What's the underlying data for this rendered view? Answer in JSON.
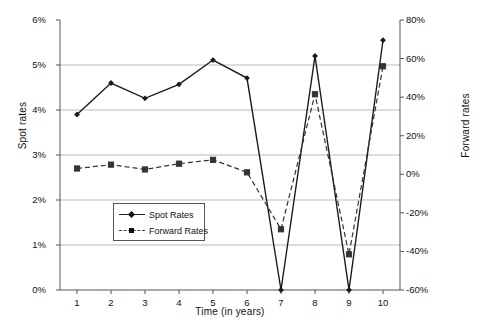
{
  "chart_data": {
    "type": "line",
    "title": "",
    "subtitle": "",
    "xlabel": "Time (in years)",
    "ylabel": "Spot rates",
    "y2label": "Forward rates",
    "x": [
      1,
      2,
      3,
      4,
      5,
      6,
      7,
      8,
      9,
      10
    ],
    "xtick_labels": [
      "1",
      "2",
      "3",
      "4",
      "5",
      "6",
      "7",
      "8",
      "9",
      "10"
    ],
    "xlim": [
      0.5,
      10.5
    ],
    "ylim": [
      0,
      6
    ],
    "y2lim": [
      -60,
      80
    ],
    "ytick_labels": [
      "0%",
      "1%",
      "2%",
      "3%",
      "4%",
      "5%",
      "6%"
    ],
    "ytick_values": [
      0,
      1,
      2,
      3,
      4,
      5,
      6
    ],
    "y2tick_labels": [
      "-60%",
      "-40%",
      "-20%",
      "0%",
      "20%",
      "40%",
      "60%",
      "80%"
    ],
    "y2tick_values": [
      -60,
      -40,
      -20,
      0,
      20,
      40,
      60,
      80
    ],
    "grid": "horizontal",
    "legend_position": "center-left-inside",
    "series": [
      {
        "name": "Spot Rates",
        "axis": "left",
        "line_style": "solid",
        "marker": "diamond",
        "color": "#1a1a1a",
        "values": [
          3.9,
          4.6,
          4.26,
          4.57,
          5.11,
          4.71,
          0.0,
          5.2,
          0.0,
          5.55
        ]
      },
      {
        "name": "Forward Rates",
        "axis": "right",
        "line_style": "dashed",
        "marker": "square",
        "color": "#333333",
        "values": [
          3.0,
          5.0,
          2.5,
          5.5,
          7.5,
          1.0,
          -28.5,
          41.5,
          -41.5,
          56.0
        ]
      }
    ]
  },
  "legend": {
    "items": [
      {
        "label": "Spot Rates"
      },
      {
        "label": "Forward Rates"
      }
    ]
  },
  "colors": {
    "series_spot": "#1a1a1a",
    "series_forward": "#333333",
    "gridline": "#b9b9b9",
    "axis": "#555555",
    "background": "#ffffff"
  }
}
